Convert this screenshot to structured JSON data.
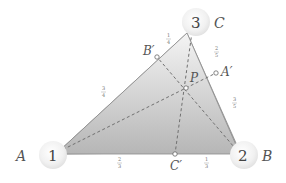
{
  "diagram": {
    "type": "triangle-cevians",
    "vertices": [
      {
        "id": "A",
        "label": "A",
        "weight": "1"
      },
      {
        "id": "B",
        "label": "B",
        "weight": "2"
      },
      {
        "id": "C",
        "label": "C",
        "weight": "3"
      }
    ],
    "cevian_feet": [
      {
        "id": "A'",
        "label": "A′",
        "on_side": "BC"
      },
      {
        "id": "B'",
        "label": "B′",
        "on_side": "CA"
      },
      {
        "id": "C'",
        "label": "C′",
        "on_side": "AB"
      }
    ],
    "intersection": {
      "id": "P",
      "label": "P"
    },
    "segment_ratios": {
      "AB_prime": {
        "num": "3",
        "den": "4"
      },
      "B_prime_C": {
        "num": "1",
        "den": "4"
      },
      "CA_prime": {
        "num": "2",
        "den": "5"
      },
      "A_prime_B": {
        "num": "3",
        "den": "5"
      },
      "AC_prime": {
        "num": "2",
        "den": "3"
      },
      "C_prime_B": {
        "num": "1",
        "den": "3"
      }
    },
    "colors": {
      "fill_top": "#f2f2f2",
      "fill_bottom": "#b8b8b8",
      "edge": "#8a8a8a",
      "cevian": "#707070",
      "ball": "#f4f4f4"
    }
  }
}
